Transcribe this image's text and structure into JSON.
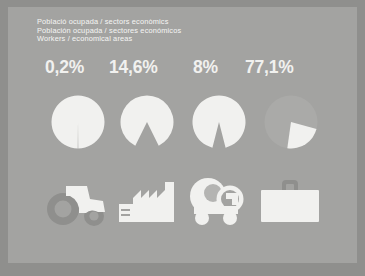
{
  "poster": {
    "background_color": "#8f8f8d",
    "panel_color": "#a3a3a1",
    "ink_color": "#f1f1ef"
  },
  "titles": {
    "line_ca": "Població ocupada / sectors econòmics",
    "line_es": "Población ocupada / sectores económicos",
    "line_en": "Workers / economical areas"
  },
  "chart_data": {
    "type": "pie",
    "title": "Població ocupada / sectors econòmics",
    "categories": [
      "Agricultura",
      "Indústria",
      "Construcció",
      "Serveis"
    ],
    "labels": [
      "0,2%",
      "14,6%",
      "8%",
      "77,1%"
    ],
    "values": [
      0.2,
      14.6,
      8,
      77.1
    ],
    "ylabel": "",
    "xlabel": "",
    "legend": "none",
    "grid": false,
    "slice_color": "#f1f1ef",
    "remainder_color": "#aaaaa8",
    "note": "Each disc shows its sector share; the first three render the share as a notch removed from a white disc, the fourth renders the 77,1% share as the large grey sector with a white remainder wedge."
  },
  "icons": [
    {
      "name": "tractor-icon",
      "sector": "Agricultura"
    },
    {
      "name": "factory-icon",
      "sector": "Indústria"
    },
    {
      "name": "cement-mixer-icon",
      "sector": "Construcció"
    },
    {
      "name": "briefcase-icon",
      "sector": "Serveis"
    }
  ]
}
